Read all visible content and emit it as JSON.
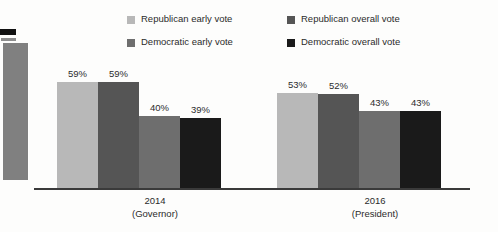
{
  "chart_data": {
    "type": "bar",
    "title": "",
    "xlabel": "",
    "ylabel": "",
    "grid": false,
    "legend_position": "top",
    "ylim": [
      0,
      70
    ],
    "categories": [
      "2014\n(Governor)",
      "2016\n(President)"
    ],
    "category_lines": [
      {
        "year": "2014",
        "office": "(Governor)"
      },
      {
        "year": "2016",
        "office": "(President)"
      }
    ],
    "series": [
      {
        "name": "Republican early vote",
        "color": "#b8b8b8",
        "values": [
          59,
          53
        ],
        "labels": [
          "59%",
          "53%"
        ]
      },
      {
        "name": "Republican overall vote",
        "color": "#555555",
        "values": [
          59,
          52
        ],
        "labels": [
          "59%",
          "52%"
        ]
      },
      {
        "name": "Democratic early vote",
        "color": "#6e6e6e",
        "values": [
          40,
          43
        ],
        "labels": [
          "40%",
          "43%"
        ]
      },
      {
        "name": "Democratic overall vote",
        "color": "#1a1a1a",
        "values": [
          39,
          43
        ],
        "labels": [
          "39%",
          "43%"
        ]
      }
    ]
  },
  "legend": {
    "items": [
      {
        "label": "Republican early vote",
        "color": "#b8b8b8",
        "icon": "legend-swatch-icon"
      },
      {
        "label": "Republican overall vote",
        "color": "#555555",
        "icon": "legend-swatch-icon"
      },
      {
        "label": "Democratic early vote",
        "color": "#6e6e6e",
        "icon": "legend-swatch-icon"
      },
      {
        "label": "Democratic overall vote",
        "color": "#1a1a1a",
        "icon": "legend-swatch-icon"
      }
    ]
  },
  "axis": {
    "baseline_color": "#3a3a3a"
  },
  "page_artifacts": {
    "left_partial_bar_color": "#808080",
    "left_black_mark_color": "#111111",
    "background_color": "#fdfdfc"
  }
}
